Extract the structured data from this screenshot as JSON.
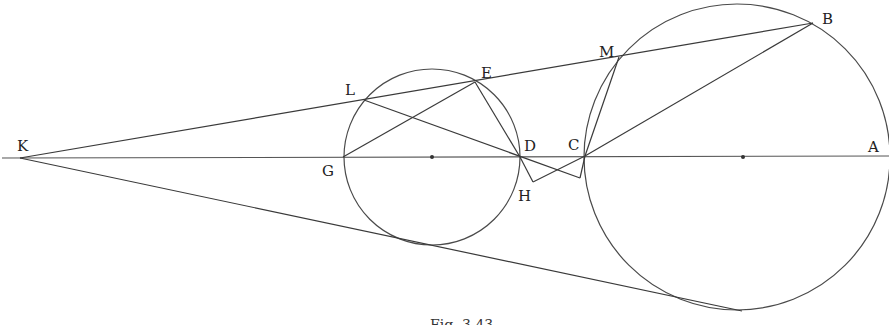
{
  "figure": {
    "caption": "Fig. 3.43",
    "colors": {
      "line": "#3a3a3a",
      "circle": "#4a4a4a",
      "background": "#ffffff"
    },
    "circles": [
      {
        "name": "small-circle",
        "cx": 432,
        "cy": 157,
        "r": 88
      },
      {
        "name": "large-circle",
        "cx": 737,
        "cy": 157,
        "r": 153
      }
    ],
    "points": {
      "K": {
        "label": "K",
        "x": 20,
        "y": 158
      },
      "G": {
        "label": "G",
        "x": 343,
        "y": 157
      },
      "D": {
        "label": "D",
        "x": 520,
        "y": 157
      },
      "C": {
        "label": "C",
        "x": 585,
        "y": 156
      },
      "A": {
        "label": "A",
        "x": 889,
        "y": 156
      },
      "L": {
        "label": "L",
        "x": 364,
        "y": 100
      },
      "E": {
        "label": "E",
        "x": 475,
        "y": 82
      },
      "M": {
        "label": "M",
        "x": 619,
        "y": 57
      },
      "B": {
        "label": "B",
        "x": 813,
        "y": 23
      },
      "H": {
        "label": "H",
        "x": 533,
        "y": 182
      }
    }
  }
}
